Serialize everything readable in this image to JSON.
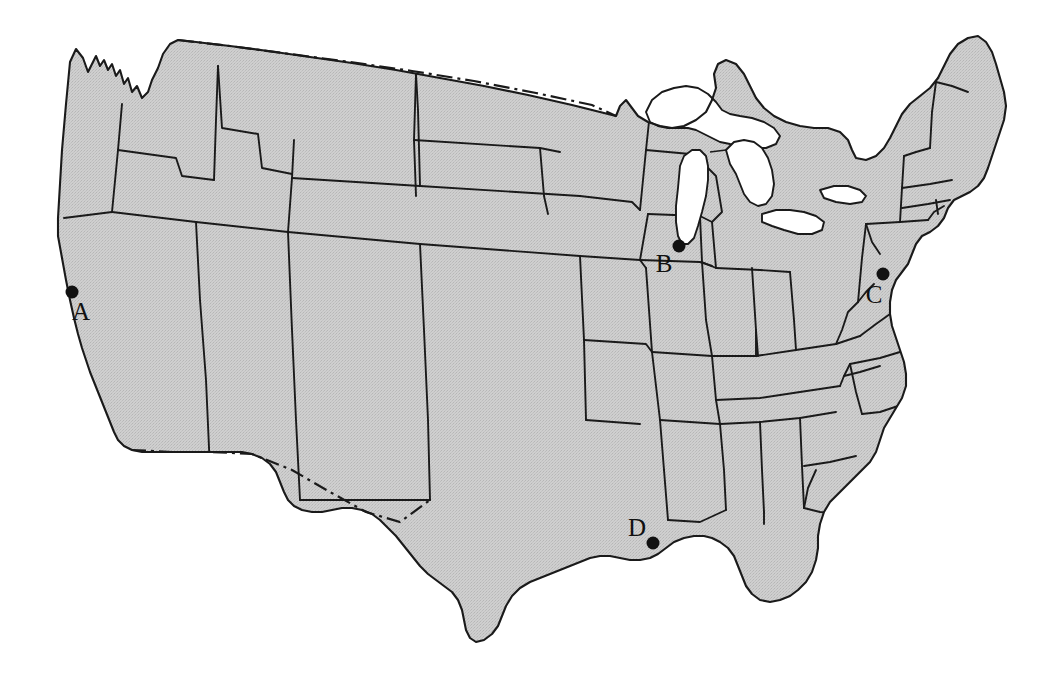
{
  "page_header": {
    "folio": "434",
    "separator": "•",
    "title": "The Ohio Country"
  },
  "figure": {
    "caption": "",
    "map_name": "contiguous-united-states",
    "fill_color": "#c9c9c9",
    "outline_color": "#1a1a1a",
    "water_color": "#ffffff",
    "background_color": "#ffffff",
    "marker_color": "#111111"
  },
  "markers": [
    {
      "id": "A",
      "label": "A",
      "dot_x": 72,
      "dot_y": 292,
      "label_x": 81,
      "label_y": 311
    },
    {
      "id": "B",
      "label": "B",
      "dot_x": 679,
      "dot_y": 246,
      "label_x": 664,
      "label_y": 263
    },
    {
      "id": "C",
      "label": "C",
      "dot_x": 883,
      "dot_y": 274,
      "label_x": 874,
      "label_y": 294
    },
    {
      "id": "D",
      "label": "D",
      "dot_x": 653,
      "dot_y": 543,
      "label_x": 637,
      "label_y": 527
    }
  ],
  "legend": {
    "border_style_canada": "dash-dot",
    "border_style_mexico": "dash-dot",
    "border_style_states": "solid"
  }
}
